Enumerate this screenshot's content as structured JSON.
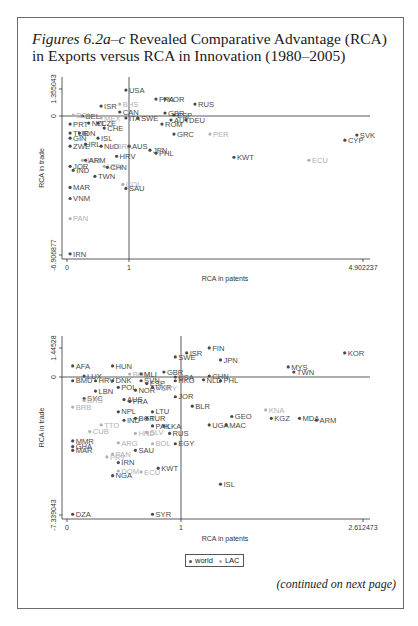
{
  "figure": {
    "title_italic": "Figures 6.2a–c",
    "title_rest": " Revealed Comparative Advantage (RCA) in Exports versus RCA in Innovation (1980–2005)",
    "continued": "(continued on next page)",
    "legend": [
      {
        "label": "world",
        "color": "#555555"
      },
      {
        "label": "LAC",
        "color": "#b0b0b0"
      }
    ]
  },
  "chart_data": [
    {
      "type": "scatter",
      "title": "",
      "xlabel": "RCA in patents",
      "ylabel": "RCA in trade",
      "xlim": [
        0,
        4.902237
      ],
      "ylim": [
        -6.906877,
        1.355043
      ],
      "x_ticks": [
        "0",
        "1",
        "4.902237"
      ],
      "y_ticks": [
        "-6.906877",
        "0",
        "1.355043"
      ],
      "reference_lines": {
        "x": 1,
        "y": 0
      },
      "grid": false,
      "legend": [
        "world",
        "LAC"
      ],
      "frame": {
        "x0": 67,
        "x1": 129,
        "xmax_px": 363,
        "xmax": 4.902237,
        "y_top_px": 89,
        "y_top": 1.355043,
        "y0_px": 116,
        "y_bot_px": 255,
        "y_bot": -6.906877
      },
      "points": [
        {
          "label": "USA",
          "x": 0.95,
          "y": 1.3,
          "group": "world"
        },
        {
          "label": "ISR",
          "x": 0.55,
          "y": 0.5,
          "group": "world"
        },
        {
          "label": "BHS",
          "x": 0.85,
          "y": 0.6,
          "group": "LAC"
        },
        {
          "label": "FRA",
          "x": 1.45,
          "y": 0.85,
          "group": "world"
        },
        {
          "label": "KOR",
          "x": 1.6,
          "y": 0.85,
          "group": "world"
        },
        {
          "label": "RUS",
          "x": 2.1,
          "y": 0.6,
          "group": "world"
        },
        {
          "label": "BEL",
          "x": 0.25,
          "y": 0.0,
          "group": "world"
        },
        {
          "label": "BOL",
          "x": 0.1,
          "y": 0.05,
          "group": "LAC"
        },
        {
          "label": "CAN",
          "x": 0.85,
          "y": 0.2,
          "group": "world"
        },
        {
          "label": "GBR",
          "x": 1.6,
          "y": 0.15,
          "group": "world"
        },
        {
          "label": "ESP",
          "x": 1.75,
          "y": 0.05,
          "group": "world"
        },
        {
          "label": "ITA",
          "x": 0.95,
          "y": -0.1,
          "group": "world"
        },
        {
          "label": "SWE",
          "x": 1.15,
          "y": -0.1,
          "group": "world"
        },
        {
          "label": "AUT",
          "x": 1.7,
          "y": -0.2,
          "group": "world"
        },
        {
          "label": "DEU",
          "x": 1.95,
          "y": -0.2,
          "group": "world"
        },
        {
          "label": "ROM",
          "x": 1.55,
          "y": -0.4,
          "group": "world"
        },
        {
          "label": "MEX",
          "x": 0.55,
          "y": -0.1,
          "group": "LAC"
        },
        {
          "label": "PRT",
          "x": 0.05,
          "y": -0.4,
          "group": "world"
        },
        {
          "label": "NZL",
          "x": 0.35,
          "y": -0.35,
          "group": "world"
        },
        {
          "label": "CZE",
          "x": 0.5,
          "y": -0.35,
          "group": "world"
        },
        {
          "label": "CHE",
          "x": 0.6,
          "y": -0.6,
          "group": "world"
        },
        {
          "label": "GRC",
          "x": 1.75,
          "y": -0.9,
          "group": "world"
        },
        {
          "label": "PER",
          "x": 2.35,
          "y": -0.9,
          "group": "LAC"
        },
        {
          "label": "TUR",
          "x": 0.05,
          "y": -0.85,
          "group": "world"
        },
        {
          "label": "IDN",
          "x": 0.2,
          "y": -0.85,
          "group": "world"
        },
        {
          "label": "GIN",
          "x": 0.05,
          "y": -1.1,
          "group": "world"
        },
        {
          "label": "ISL",
          "x": 0.5,
          "y": -1.1,
          "group": "world"
        },
        {
          "label": "ZWE",
          "x": 0.05,
          "y": -1.5,
          "group": "world"
        },
        {
          "label": "IRL",
          "x": 0.3,
          "y": -1.4,
          "group": "world"
        },
        {
          "label": "NLD",
          "x": 0.55,
          "y": -1.5,
          "group": "world"
        },
        {
          "label": "BRA",
          "x": 0.75,
          "y": -1.5,
          "group": "LAC"
        },
        {
          "label": "AUS",
          "x": 1.0,
          "y": -1.5,
          "group": "world"
        },
        {
          "label": "JPN",
          "x": 1.35,
          "y": -1.7,
          "group": "world"
        },
        {
          "label": "PHL",
          "x": 1.45,
          "y": -1.85,
          "group": "world"
        },
        {
          "label": "HRV",
          "x": 0.8,
          "y": -2.0,
          "group": "world"
        },
        {
          "label": "JAM",
          "x": 0.25,
          "y": -2.2,
          "group": "LAC"
        },
        {
          "label": "ARM",
          "x": 0.3,
          "y": -2.2,
          "group": "world"
        },
        {
          "label": "JOR",
          "x": 0.05,
          "y": -2.5,
          "group": "world"
        },
        {
          "label": "VEN",
          "x": 0.6,
          "y": -2.5,
          "group": "LAC"
        },
        {
          "label": "CHN",
          "x": 0.65,
          "y": -2.55,
          "group": "world"
        },
        {
          "label": "IND",
          "x": 0.1,
          "y": -2.7,
          "group": "world"
        },
        {
          "label": "TWN",
          "x": 0.45,
          "y": -3.0,
          "group": "world"
        },
        {
          "label": "KWT",
          "x": 2.75,
          "y": -2.05,
          "group": "world"
        },
        {
          "label": "ECU",
          "x": 4.0,
          "y": -2.2,
          "group": "LAC"
        },
        {
          "label": "SVK",
          "x": 4.8,
          "y": -0.95,
          "group": "world"
        },
        {
          "label": "CYP",
          "x": 4.6,
          "y": -1.2,
          "group": "world"
        },
        {
          "label": "COL",
          "x": 0.9,
          "y": -3.4,
          "group": "LAC"
        },
        {
          "label": "SAU",
          "x": 0.95,
          "y": -3.6,
          "group": "world"
        },
        {
          "label": "MAR",
          "x": 0.05,
          "y": -3.55,
          "group": "world"
        },
        {
          "label": "VNM",
          "x": 0.05,
          "y": -4.1,
          "group": "world"
        },
        {
          "label": "PAN",
          "x": 0.05,
          "y": -5.1,
          "group": "LAC"
        },
        {
          "label": "IRN",
          "x": 0.05,
          "y": -6.85,
          "group": "world"
        }
      ]
    },
    {
      "type": "scatter",
      "title": "",
      "xlabel": "RCA in patents",
      "ylabel": "RCA in trade",
      "xlim": [
        0,
        2.612473
      ],
      "ylim": [
        -7.339043,
        1.44528
      ],
      "x_ticks": [
        "0",
        "1",
        "2.612473"
      ],
      "y_ticks": [
        "-7.339043",
        "0",
        "1.44528"
      ],
      "reference_lines": {
        "x": 1,
        "y": 0
      },
      "grid": false,
      "legend": [
        "world",
        "LAC"
      ],
      "frame": {
        "x0": 67,
        "x1": 181,
        "xmax_px": 363,
        "xmax": 2.612473,
        "y_top_px": 348,
        "y_top": 1.44528,
        "y0_px": 377,
        "y_bot_px": 515,
        "y_bot": -7.339043
      },
      "points": [
        {
          "label": "FIN",
          "x": 1.25,
          "y": 1.45,
          "group": "world"
        },
        {
          "label": "ISR",
          "x": 1.05,
          "y": 1.2,
          "group": "world"
        },
        {
          "label": "SWE",
          "x": 0.95,
          "y": 1.0,
          "group": "world"
        },
        {
          "label": "JPN",
          "x": 1.35,
          "y": 0.85,
          "group": "world"
        },
        {
          "label": "KOR",
          "x": 2.45,
          "y": 1.2,
          "group": "world"
        },
        {
          "label": "MYS",
          "x": 1.95,
          "y": 0.5,
          "group": "world"
        },
        {
          "label": "TWN",
          "x": 2.0,
          "y": 0.25,
          "group": "world"
        },
        {
          "label": "AFA",
          "x": 0.05,
          "y": 0.55,
          "group": "world"
        },
        {
          "label": "HUN",
          "x": 0.4,
          "y": 0.55,
          "group": "world"
        },
        {
          "label": "LUX",
          "x": 0.15,
          "y": 0.05,
          "group": "world"
        },
        {
          "label": "BOM",
          "x": 0.55,
          "y": 0.15,
          "group": "LAC"
        },
        {
          "label": "MLI",
          "x": 0.65,
          "y": 0.15,
          "group": "world"
        },
        {
          "label": "GBR",
          "x": 0.85,
          "y": 0.25,
          "group": "world"
        },
        {
          "label": "USA",
          "x": 0.95,
          "y": 0.0,
          "group": "world"
        },
        {
          "label": "CHN",
          "x": 1.25,
          "y": 0.05,
          "group": "world"
        },
        {
          "label": "NLD",
          "x": 1.2,
          "y": -0.15,
          "group": "world"
        },
        {
          "label": "PHL",
          "x": 1.35,
          "y": -0.2,
          "group": "world"
        },
        {
          "label": "HKG",
          "x": 0.95,
          "y": -0.2,
          "group": "world"
        },
        {
          "label": "BMU",
          "x": 0.05,
          "y": -0.2,
          "group": "world"
        },
        {
          "label": "HRV",
          "x": 0.25,
          "y": -0.2,
          "group": "world"
        },
        {
          "label": "DNK",
          "x": 0.4,
          "y": -0.2,
          "group": "world"
        },
        {
          "label": "SVN",
          "x": 0.65,
          "y": -0.2,
          "group": "world"
        },
        {
          "label": "ESP",
          "x": 0.7,
          "y": -0.35,
          "group": "world"
        },
        {
          "label": "POL",
          "x": 0.45,
          "y": -0.55,
          "group": "world"
        },
        {
          "label": "NOR",
          "x": 0.6,
          "y": -0.7,
          "group": "world"
        },
        {
          "label": "UKR",
          "x": 0.75,
          "y": -0.55,
          "group": "world"
        },
        {
          "label": "URY",
          "x": 0.8,
          "y": -0.6,
          "group": "LAC"
        },
        {
          "label": "LBN",
          "x": 0.25,
          "y": -0.75,
          "group": "world"
        },
        {
          "label": "JOR",
          "x": 0.95,
          "y": -1.05,
          "group": "world"
        },
        {
          "label": "SYC",
          "x": 0.15,
          "y": -1.15,
          "group": "world"
        },
        {
          "label": "BHS",
          "x": 0.15,
          "y": -1.25,
          "group": "LAC"
        },
        {
          "label": "AUS",
          "x": 0.5,
          "y": -1.2,
          "group": "world"
        },
        {
          "label": "FRA",
          "x": 0.55,
          "y": -1.3,
          "group": "world"
        },
        {
          "label": "BRB",
          "x": 0.05,
          "y": -1.6,
          "group": "LAC"
        },
        {
          "label": "BLR",
          "x": 1.1,
          "y": -1.55,
          "group": "world"
        },
        {
          "label": "GEO",
          "x": 1.45,
          "y": -2.1,
          "group": "world"
        },
        {
          "label": "KNA",
          "x": 1.75,
          "y": -1.75,
          "group": "LAC"
        },
        {
          "label": "KGZ",
          "x": 1.8,
          "y": -2.2,
          "group": "world"
        },
        {
          "label": "MDA",
          "x": 2.05,
          "y": -2.2,
          "group": "world"
        },
        {
          "label": "ARM",
          "x": 2.2,
          "y": -2.3,
          "group": "world"
        },
        {
          "label": "UGA",
          "x": 1.25,
          "y": -2.55,
          "group": "world"
        },
        {
          "label": "MAC",
          "x": 1.4,
          "y": -2.55,
          "group": "world"
        },
        {
          "label": "NPL",
          "x": 0.45,
          "y": -1.85,
          "group": "world"
        },
        {
          "label": "LTU",
          "x": 0.75,
          "y": -1.85,
          "group": "world"
        },
        {
          "label": "IND",
          "x": 0.5,
          "y": -2.3,
          "group": "world"
        },
        {
          "label": "BGR",
          "x": 0.6,
          "y": -2.2,
          "group": "world"
        },
        {
          "label": "TUR",
          "x": 0.7,
          "y": -2.2,
          "group": "world"
        },
        {
          "label": "TTO",
          "x": 0.3,
          "y": -2.55,
          "group": "LAC"
        },
        {
          "label": "PAK",
          "x": 0.75,
          "y": -2.6,
          "group": "world"
        },
        {
          "label": "LKA",
          "x": 0.85,
          "y": -2.6,
          "group": "world"
        },
        {
          "label": "SLV",
          "x": 0.7,
          "y": -2.95,
          "group": "LAC"
        },
        {
          "label": "HND",
          "x": 0.6,
          "y": -3.0,
          "group": "LAC"
        },
        {
          "label": "CUB",
          "x": 0.2,
          "y": -2.9,
          "group": "LAC"
        },
        {
          "label": "RUS",
          "x": 0.9,
          "y": -3.0,
          "group": "world"
        },
        {
          "label": "BOL",
          "x": 0.75,
          "y": -3.55,
          "group": "LAC"
        },
        {
          "label": "EGY",
          "x": 0.95,
          "y": -3.55,
          "group": "world"
        },
        {
          "label": "ARG",
          "x": 0.45,
          "y": -3.5,
          "group": "LAC"
        },
        {
          "label": "MMR",
          "x": 0.05,
          "y": -3.4,
          "group": "world"
        },
        {
          "label": "GHA",
          "x": 0.05,
          "y": -3.7,
          "group": "world"
        },
        {
          "label": "MAR",
          "x": 0.05,
          "y": -3.9,
          "group": "world"
        },
        {
          "label": "SAU",
          "x": 0.6,
          "y": -3.9,
          "group": "world"
        },
        {
          "label": "PAN",
          "x": 0.4,
          "y": -4.1,
          "group": "LAC"
        },
        {
          "label": "PRY",
          "x": 0.35,
          "y": -4.25,
          "group": "LAC"
        },
        {
          "label": "IRN",
          "x": 0.45,
          "y": -4.55,
          "group": "world"
        },
        {
          "label": "DOM",
          "x": 0.45,
          "y": -5.0,
          "group": "LAC"
        },
        {
          "label": "ECU",
          "x": 0.65,
          "y": -5.05,
          "group": "LAC"
        },
        {
          "label": "KWT",
          "x": 0.8,
          "y": -4.85,
          "group": "world"
        },
        {
          "label": "NGA",
          "x": 0.4,
          "y": -5.25,
          "group": "world"
        },
        {
          "label": "ISL",
          "x": 1.35,
          "y": -5.7,
          "group": "world"
        },
        {
          "label": "DZA",
          "x": 0.05,
          "y": -7.3,
          "group": "world"
        },
        {
          "label": "SYR",
          "x": 0.75,
          "y": -7.3,
          "group": "world"
        }
      ]
    }
  ]
}
